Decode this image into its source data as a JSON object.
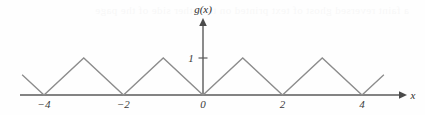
{
  "figure": {
    "name": "triangle-wave-graph",
    "background_color": "#fefefe",
    "curve_color": "#8c8c8c",
    "axis_color": "#5a5a5a",
    "label_color": "#3a3a3a",
    "bleed_through_text": "a faint reversed ghost of text printed on the other side of the page"
  },
  "chart_data": {
    "type": "line",
    "title": "",
    "xlabel": "x",
    "ylabel": "g(x)",
    "function_label": "g(x)",
    "xlim": [
      -4.6,
      4.6
    ],
    "ylim": [
      0,
      1.45
    ],
    "grid": false,
    "legend": null,
    "period": 2,
    "amplitude": 1,
    "x": [
      -4.55,
      -4,
      -3,
      -2,
      -1,
      0,
      1,
      2,
      3,
      4,
      4.55
    ],
    "y": [
      0.55,
      0,
      1,
      0,
      1,
      0,
      1,
      0,
      1,
      0,
      0.55
    ],
    "x_ticks": [
      -4,
      -2,
      0,
      2,
      4
    ],
    "x_tick_labels": [
      "−4",
      "−2",
      "0",
      "2",
      "4"
    ],
    "y_ticks": [
      1
    ],
    "y_tick_labels": [
      "1"
    ],
    "x_axis_arrow": true,
    "y_axis_arrow": true
  },
  "labels": {
    "y_axis_name": "g(x)",
    "x_axis_name": "x",
    "y_tick_1": "1",
    "x_tick_minus4": "−4",
    "x_tick_minus2": "−2",
    "x_tick_0": "0",
    "x_tick_2": "2",
    "x_tick_4": "4"
  }
}
